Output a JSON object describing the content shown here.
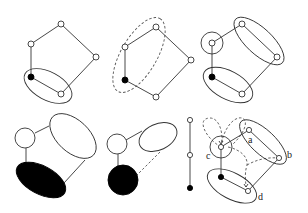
{
  "figure": {
    "panels": [
      {
        "id": "p1",
        "description": "Pentagon graph with one filled node; ellipse grouping bottom two nodes"
      },
      {
        "id": "p2",
        "description": "Pentagon graph; dashed ellipse grouping left three nodes"
      },
      {
        "id": "p3",
        "description": "Pentagon graph; circle around one node, ellipses around two node pairs"
      },
      {
        "id": "p4",
        "description": "Contracted graph: circle, large ellipse, filled ellipse"
      },
      {
        "id": "p5",
        "description": "Contracted graph: circle, ellipse, filled circle, dashed edge"
      },
      {
        "id": "p6",
        "description": "Path of three nodes (two open, one filled)"
      },
      {
        "id": "p7",
        "description": "Labeled graph with dashed loops and arrows"
      }
    ],
    "labels": {
      "a": "a",
      "b": "b",
      "c": "c",
      "d": "d"
    },
    "colors": {
      "stroke": "#333333",
      "fill_dark": "#000000",
      "background": "#ffffff"
    }
  }
}
